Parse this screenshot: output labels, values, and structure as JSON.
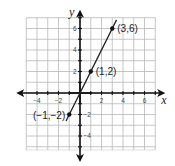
{
  "chart_data": {
    "type": "line",
    "title": "",
    "xlabel": "x",
    "ylabel": "y",
    "xlim": [
      -5,
      7
    ],
    "ylim": [
      -5.3,
      7
    ],
    "grid": true,
    "x_ticks": [
      -4,
      -2,
      2,
      4,
      6
    ],
    "y_ticks": [
      -4,
      -2,
      2,
      4,
      6
    ],
    "x_tick_labels": [
      "−4",
      "−2",
      "2",
      "4",
      "6"
    ],
    "y_tick_labels": [
      "−4",
      "−2",
      "2",
      "4",
      "6"
    ],
    "series": [
      {
        "name": "y = 2x",
        "line_x": [
          -1.3,
          3.4
        ],
        "line_y": [
          -2.6,
          6.8
        ],
        "points": [
          {
            "x": -1,
            "y": -2,
            "label": "(−1,−2)"
          },
          {
            "x": 1,
            "y": 2,
            "label": "(1,2)"
          },
          {
            "x": 3,
            "y": 6,
            "label": "(3,6)"
          }
        ]
      }
    ]
  },
  "labels": {
    "x_axis": "x",
    "y_axis": "y",
    "point_a": "(−1,−2)",
    "point_b": "(1,2)",
    "point_c": "(3,6)"
  }
}
